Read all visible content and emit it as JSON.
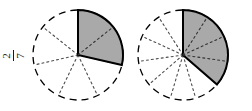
{
  "figure": {
    "type": "fraction-circle-pair",
    "background_color": "#ffffff",
    "shade_color": "#a9a9a9",
    "outline_color": "#000000",
    "spoke_color": "#4d4d4d"
  },
  "pies": [
    {
      "id": "left",
      "name": "fraction-circle-two-sevenths",
      "numerator": "2",
      "denominator": "7",
      "total_sectors": 7,
      "shaded_sectors": 2,
      "shaded_fraction_decimal": "0.2857",
      "shaded_sweep_degrees": "102.9",
      "center_x": 78,
      "center_y": 55,
      "radius": 45,
      "label_position": "left",
      "label_rotation_degrees": "-90"
    },
    {
      "id": "right",
      "name": "fraction-circle-four-elevenths",
      "numerator": "4",
      "denominator": "11",
      "total_sectors": 11,
      "shaded_sectors": 4,
      "shaded_fraction_decimal": "0.3636",
      "shaded_sweep_degrees": "130.9",
      "center_x": 57,
      "center_y": 55,
      "radius": 45,
      "label_position": "right",
      "label_rotation_degrees": "0"
    }
  ]
}
